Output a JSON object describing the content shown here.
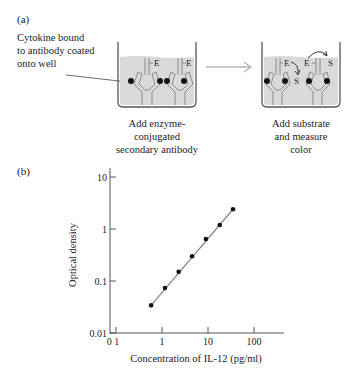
{
  "panel_a": {
    "label": "(a)",
    "annotation": [
      "Cytokine bound",
      "to antibody coated",
      "onto well"
    ],
    "well_1": {
      "caption": [
        "Add enzyme-",
        "conjugated",
        "secondary antibody"
      ],
      "enzyme_label": "E"
    },
    "well_2": {
      "caption": [
        "Add substrate",
        "and measure",
        "color"
      ],
      "enzyme_label": "E",
      "substrate_label": "S"
    },
    "colors": {
      "liquid": "#d9d9d9",
      "outline": "#555555",
      "antigen": "#111111"
    }
  },
  "panel_b": {
    "label": "(b)"
  },
  "chart_data": {
    "type": "scatter",
    "title": "",
    "xlabel": "Concentration of IL-12 (pg/ml)",
    "ylabel": "Optical density",
    "xscale": "log",
    "yscale": "log",
    "xlim": [
      0.1,
      300
    ],
    "ylim": [
      0.01,
      10
    ],
    "x_ticks": [
      "0.1",
      "1",
      "10",
      "100"
    ],
    "x_tick_display": [
      "0 1",
      "1",
      "10",
      "100"
    ],
    "y_ticks": [
      "0.01",
      "0.1",
      "1",
      "10"
    ],
    "grid": false,
    "legend": null,
    "series": [
      {
        "name": "Standard curve",
        "x": [
          0.58,
          1.16,
          2.3,
          4.5,
          9.0,
          18,
          35
        ],
        "y": [
          0.034,
          0.073,
          0.15,
          0.3,
          0.64,
          1.19,
          2.4
        ],
        "marker": "filled-circle",
        "fit_line": true
      }
    ],
    "colors": {
      "axis": "#555555",
      "points": "#111111",
      "fit_line": "#888888"
    }
  }
}
